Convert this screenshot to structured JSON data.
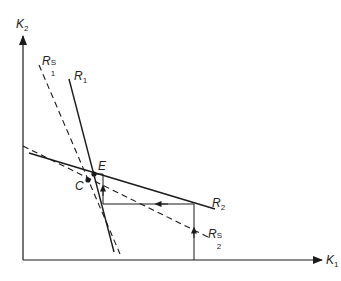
{
  "diagram": {
    "axes": {
      "x_label": "K",
      "x_label_sub": "1",
      "y_label": "K",
      "y_label_sub": "2"
    },
    "curves": [
      {
        "id": "R1",
        "label": "R",
        "sub": "1",
        "sup": "",
        "style": "solid"
      },
      {
        "id": "R1S",
        "label": "R",
        "sub": "1",
        "sup": "S",
        "style": "dashed"
      },
      {
        "id": "R2",
        "label": "R",
        "sub": "2",
        "sup": "",
        "style": "solid"
      },
      {
        "id": "R2S",
        "label": "R",
        "sub": "2",
        "sup": "S",
        "style": "dashed"
      }
    ],
    "points": [
      {
        "id": "E",
        "label": "E"
      },
      {
        "id": "C",
        "label": "C"
      }
    ],
    "colors": {
      "line": "#1a1a1a",
      "background": "#ffffff"
    }
  }
}
